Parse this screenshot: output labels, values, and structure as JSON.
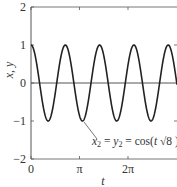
{
  "chart_data": {
    "type": "line",
    "title": "",
    "xlabel": "t",
    "ylabel": "x, y",
    "xlim": [
      0,
      9.56
    ],
    "ylim": [
      -2,
      2
    ],
    "x_ticks": [
      {
        "value": 0,
        "label": "0"
      },
      {
        "value": 3.14159,
        "label": "π"
      },
      {
        "value": 6.28318,
        "label": "2π"
      }
    ],
    "y_ticks": [
      {
        "value": 2,
        "label": "2"
      },
      {
        "value": 1,
        "label": "1"
      },
      {
        "value": 0,
        "label": "0"
      },
      {
        "value": -1,
        "label": "−1"
      },
      {
        "value": -2,
        "label": "−2"
      }
    ],
    "series": [
      {
        "name": "x2 = y2 = cos(t √8)",
        "function": "cos(t*sqrt(8))",
        "color": "#222222"
      }
    ],
    "annotations": [
      {
        "text_main": "x",
        "sub1": "2",
        "eq1": " = ",
        "y": "y",
        "sub2": "2",
        "eq2": " = cos(",
        "t": "t",
        "sqrt": " √8 )"
      }
    ],
    "grid": false,
    "zero_line": true
  }
}
